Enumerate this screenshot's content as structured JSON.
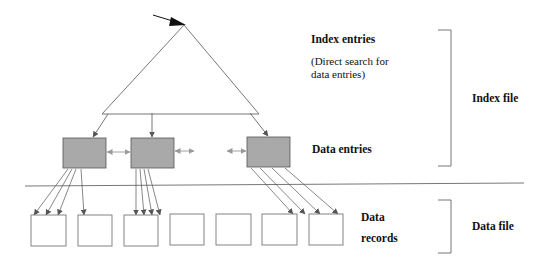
{
  "diagram": {
    "labels": {
      "index_entries": "Index entries",
      "index_entries_note_line1": "(Direct search for",
      "index_entries_note_line2": "data entries)",
      "data_entries": "Data entries",
      "data_records_line1": "Data",
      "data_records_line2": "records",
      "index_file": "Index file",
      "data_file": "Data file"
    },
    "colors": {
      "line": "#6e6e6e",
      "data_entry_fill": "#a9a9a9",
      "data_entry_stroke": "#555555",
      "record_stroke": "#777777",
      "text": "#111111"
    },
    "data_entry_boxes": 3,
    "data_record_boxes": 7
  }
}
